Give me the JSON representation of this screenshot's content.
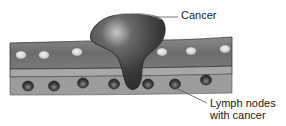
{
  "diagram": {
    "labels": {
      "cancer": "Cancer",
      "lymph_line1": "Lymph nodes",
      "lymph_line2": "with cancer"
    },
    "colors": {
      "background": "#ffffff",
      "upper_band": "#6e6e6e",
      "middle_band": "#a9a9a9",
      "lower_band": "#9a9a9a",
      "tumor": "#3e3e3e",
      "tumor_highlight": "#bdbdbd",
      "oval": "#e4e4e4",
      "node": "#4a4a4a",
      "leader_line": "#555555"
    },
    "upper_ovals_x": [
      21,
      44,
      77,
      162,
      191,
      225
    ],
    "lymph_nodes_x": [
      28,
      54,
      83,
      114,
      148,
      175,
      206
    ]
  }
}
